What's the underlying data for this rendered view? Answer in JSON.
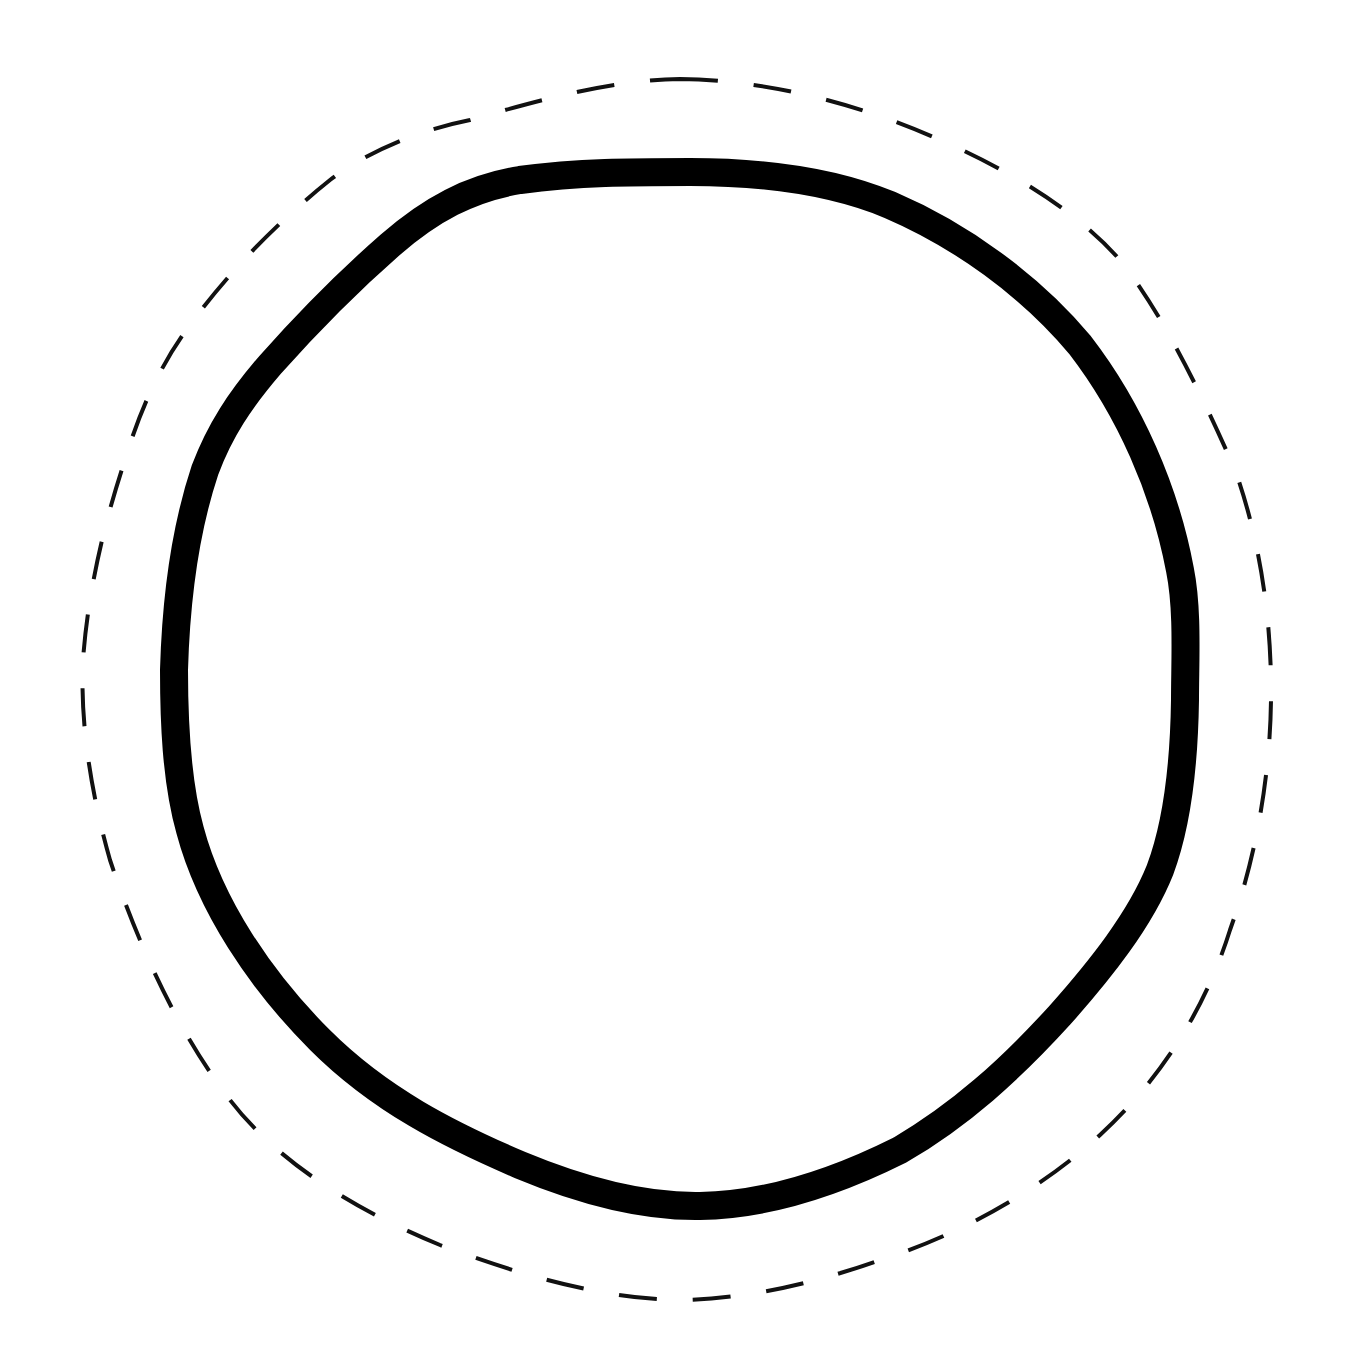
{
  "canvas": {
    "width": 1346,
    "height": 1364,
    "background": "#ffffff"
  },
  "shapes": {
    "outer_boundary": {
      "style": "dashed",
      "stroke": "#111111",
      "stroke_width": 4,
      "dasharray": "38 36",
      "path": "M 680 79 C 760 80, 850 100, 940 140 C 1020 175, 1080 215, 1120 260 C 1160 310, 1200 390, 1235 470 C 1260 540, 1272 620, 1271 700 C 1270 780, 1255 860, 1230 930 C 1205 1010, 1160 1080, 1100 1135 C 1040 1190, 960 1235, 880 1260 C 810 1285, 740 1300, 675 1300 C 600 1298, 520 1275, 440 1245 C 360 1212, 280 1165, 230 1100 C 180 1035, 140 950, 110 860 C 90 790, 80 720, 83 660 C 88 590, 105 520, 125 460 C 140 410, 160 365, 190 325 C 230 270, 280 220, 330 180 C 370 150, 420 130, 470 120 C 540 100, 610 80, 680 79 Z"
    },
    "inner_boundary": {
      "style": "solid",
      "stroke": "#000000",
      "stroke_width": 28,
      "path": "M 690 172 C 760 172, 830 180, 890 205 C 960 235, 1030 285, 1080 345 C 1130 410, 1165 490, 1180 570 C 1188 610, 1185 660, 1185 700 C 1184 770, 1175 830, 1160 870 C 1140 920, 1100 970, 1060 1015 C 1010 1070, 960 1115, 900 1150 C 840 1180, 770 1205, 700 1206 C 640 1207, 580 1190, 520 1165 C 450 1135, 380 1100, 320 1040 C 260 980, 210 905, 190 830 C 176 780, 174 720, 174 670 C 176 600, 185 530, 205 470 C 220 430, 240 400, 270 365 C 310 320, 350 280, 390 245 C 430 210, 470 188, 520 180 C 580 172, 630 172, 690 172 Z"
    }
  }
}
